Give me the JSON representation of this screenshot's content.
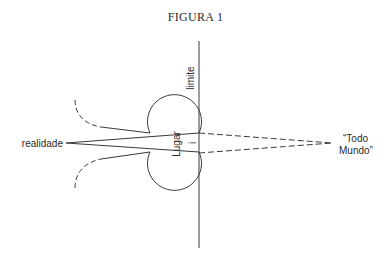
{
  "figure": {
    "title": "FIGURA 1",
    "labels": {
      "realidade": "realidade",
      "limite": "limite",
      "lugar": "Lugar",
      "i": "i",
      "todo_mundo_line1": "“Todo",
      "todo_mundo_line2": "Mundo”"
    },
    "colors": {
      "stroke": "#3a3a3a",
      "text": "#2a2a2a"
    }
  }
}
